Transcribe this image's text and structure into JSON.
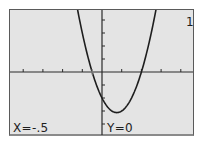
{
  "calculator": {
    "equation_number": "1",
    "cursor_x_label": "X=-.5",
    "cursor_y_label": "Y=0"
  },
  "colors": {
    "screen_bg": "#e4e4e4",
    "border": "#5a5a5a",
    "curve": "#1e1e1e",
    "axes": "#2a2a2a"
  },
  "chart_data": {
    "type": "line",
    "title": "",
    "function": "y = 2x^2 - 3x - 2",
    "xlabel": "",
    "ylabel": "",
    "xlim": [
      -4.7,
      4.7
    ],
    "ylim": [
      -4.9,
      4.9
    ],
    "x_ticks": [
      -4,
      -3,
      -2,
      -1,
      1,
      2,
      3,
      4
    ],
    "y_ticks": [
      -4,
      -3,
      -2,
      -1,
      1,
      2,
      3,
      4
    ],
    "grid": false,
    "series": [
      {
        "name": "Y1",
        "x": [
          -1.25,
          -1,
          -0.5,
          0,
          0.5,
          0.75,
          1,
          1.5,
          2,
          2.5,
          2.75
        ],
        "values": [
          4.875,
          3,
          0,
          -2,
          -3,
          -3.125,
          -3,
          -2,
          0,
          3,
          4.875
        ]
      }
    ],
    "trace_cursor": {
      "x": -0.5,
      "y": 0
    },
    "annotations": [
      "X=-.5",
      "Y=0",
      "1"
    ]
  }
}
